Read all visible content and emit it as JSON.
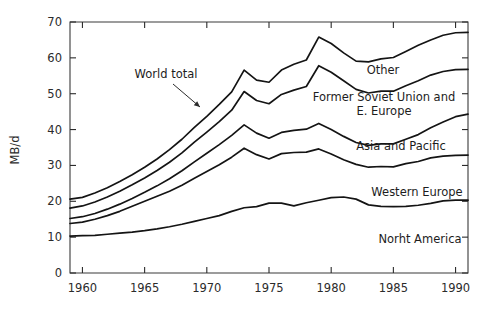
{
  "chart_data": {
    "type": "line",
    "title": "",
    "subtitle": "",
    "xlabel": "",
    "ylabel": "MB/d",
    "xlim": [
      1959,
      1991
    ],
    "ylim": [
      0,
      70
    ],
    "grid": false,
    "legend_position": "inline-annotations",
    "note": "Cumulative / stacked curves; topmost curve is the World total",
    "xticks": [
      1960,
      1965,
      1970,
      1975,
      1980,
      1985,
      1990
    ],
    "xtick_labels": [
      "1960",
      "1965",
      "1970",
      "1975",
      "1980",
      "1985",
      "1990"
    ],
    "yticks": [
      0,
      10,
      20,
      30,
      40,
      50,
      60,
      70
    ],
    "ytick_labels": [
      "0",
      "10",
      "20",
      "30",
      "40",
      "50",
      "60",
      "70"
    ],
    "x": [
      1959,
      1960,
      1961,
      1962,
      1963,
      1964,
      1965,
      1966,
      1967,
      1968,
      1969,
      1970,
      1971,
      1972,
      1973,
      1974,
      1975,
      1976,
      1977,
      1978,
      1979,
      1980,
      1981,
      1982,
      1983,
      1984,
      1985,
      1986,
      1987,
      1988,
      1989,
      1990,
      1991
    ],
    "series": [
      {
        "name": "Norht America",
        "label": "Norht America",
        "values": [
          10.3,
          10.4,
          10.5,
          10.8,
          11.1,
          11.4,
          11.8,
          12.3,
          12.9,
          13.6,
          14.4,
          15.2,
          16.0,
          17.2,
          18.2,
          18.5,
          19.5,
          19.5,
          18.7,
          19.6,
          20.3,
          21.0,
          21.2,
          20.6,
          19.0,
          18.6,
          18.5,
          18.6,
          18.9,
          19.4,
          20.1,
          20.3,
          20.3
        ]
      },
      {
        "name": "Western Europe",
        "label": "Western Europe",
        "values": [
          13.8,
          14.2,
          15.0,
          16.0,
          17.2,
          18.6,
          20.0,
          21.4,
          22.8,
          24.5,
          26.4,
          28.3,
          30.2,
          32.3,
          34.8,
          33.0,
          31.8,
          33.3,
          33.6,
          33.7,
          34.6,
          33.2,
          31.6,
          30.3,
          29.5,
          29.7,
          29.6,
          30.5,
          31.1,
          32.1,
          32.6,
          32.8,
          32.9
        ]
      },
      {
        "name": "Asia and Pacific",
        "label": "Asia and Pacific",
        "values": [
          15.2,
          15.7,
          16.6,
          17.8,
          19.2,
          20.8,
          22.5,
          24.3,
          26.3,
          28.5,
          31.0,
          33.4,
          35.8,
          38.4,
          41.3,
          39.0,
          37.6,
          39.2,
          39.8,
          40.1,
          41.7,
          40.0,
          38.1,
          36.4,
          35.6,
          36.0,
          36.0,
          37.3,
          38.6,
          40.5,
          42.1,
          43.6,
          44.3
        ]
      },
      {
        "name": "Former Soviet Union and E. Europe",
        "label": "Former Soviet Union and\nE. Europe",
        "values": [
          18.1,
          18.7,
          19.8,
          21.2,
          22.8,
          24.6,
          26.5,
          28.6,
          30.9,
          33.5,
          36.5,
          39.3,
          42.2,
          45.4,
          50.6,
          48.1,
          47.2,
          49.8,
          51.0,
          52.0,
          57.8,
          56.0,
          53.6,
          51.2,
          50.2,
          50.7,
          50.7,
          52.2,
          53.6,
          55.2,
          56.2,
          56.7,
          56.8
        ]
      },
      {
        "name": "Other",
        "label": "Other",
        "values": [
          20.6,
          21.1,
          22.3,
          23.8,
          25.5,
          27.4,
          29.5,
          31.8,
          34.4,
          37.3,
          40.6,
          43.7,
          47.0,
          50.5,
          56.6,
          53.8,
          53.2,
          56.6,
          58.2,
          59.4,
          65.8,
          64.0,
          61.4,
          59.1,
          58.9,
          59.7,
          60.1,
          61.8,
          63.5,
          65.0,
          66.3,
          67.0,
          67.1
        ]
      }
    ],
    "annotations": [
      {
        "name": "world-total",
        "text": "World total",
        "x_px": 166,
        "y_px": 78,
        "leader_from": [
          173,
          84
        ],
        "leader_to": [
          200,
          107
        ]
      }
    ]
  },
  "axes": {
    "ylabel": "MB/d"
  }
}
